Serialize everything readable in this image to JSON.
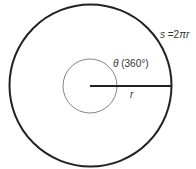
{
  "diagram": {
    "outer_circle": {
      "cx": 90.5,
      "cy": 85.5,
      "r": 81,
      "stroke": "#222222",
      "stroke_width": 2
    },
    "inner_circle": {
      "cx": 90,
      "cy": 86,
      "r": 27,
      "stroke": "#555555",
      "stroke_width": 0.8
    },
    "radius_line": {
      "x1": 90,
      "y1": 86,
      "x2": 172,
      "y2": 86,
      "stroke": "#222222",
      "stroke_width": 2
    },
    "labels": {
      "arc_length_var": "s",
      "arc_length_eq": " =2",
      "arc_length_pi": "π",
      "arc_length_r": "r",
      "angle_symbol": "θ",
      "angle_value": " (360°)",
      "radius": "r"
    }
  }
}
